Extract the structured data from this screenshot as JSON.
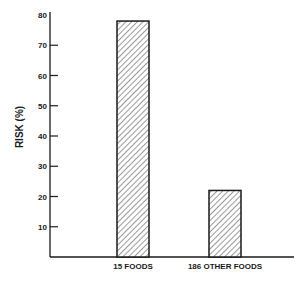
{
  "chart_data": {
    "type": "bar",
    "title": "",
    "xlabel": "",
    "ylabel": "RISK (%)",
    "categories": [
      "15 FOODS",
      "186 OTHER FOODS"
    ],
    "values": [
      78,
      22
    ],
    "ylim": [
      0,
      80
    ],
    "yticks": [
      10,
      20,
      30,
      40,
      50,
      60,
      70,
      80
    ],
    "grid": false,
    "legend": null,
    "bar_fill": "diagonal-hatch",
    "colors": {
      "ink": "#1a1a1a",
      "background": "#ffffff"
    }
  }
}
